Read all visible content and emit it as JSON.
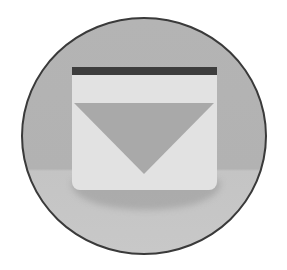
{
  "icon": {
    "name": "download-inbox-icon",
    "shape": "circle-badge",
    "colors": {
      "background": "#ffffff",
      "badge_top": "#b4b4b4",
      "badge_bottom": "#c8c8c8",
      "badge_border": "#3a3a3a",
      "box_fill": "#e2e2e2",
      "top_bar": "#3d3d3d",
      "arrow": "#a9a9a9"
    }
  }
}
